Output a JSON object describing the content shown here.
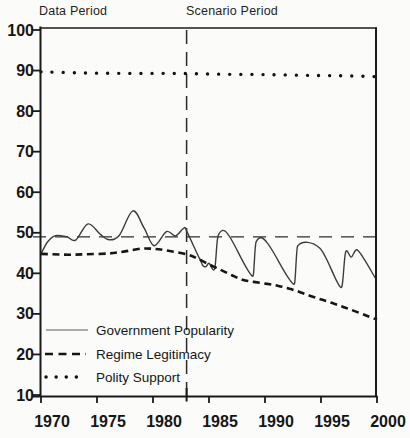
{
  "figure": {
    "annotations": {
      "data_period": "Data Period",
      "scenario_period": "Scenario Period"
    }
  },
  "chart_data": {
    "type": "line",
    "title": "",
    "xlabel": "",
    "ylabel": "",
    "xlim": [
      1970,
      2000
    ],
    "ylim": [
      10,
      100
    ],
    "x_ticks": [
      1970,
      1975,
      1980,
      1985,
      1990,
      1995,
      2000
    ],
    "y_ticks": [
      100,
      90,
      80,
      70,
      60,
      50,
      40,
      30,
      20,
      10
    ],
    "grid": false,
    "legend_position": "lower-left-inside",
    "ink_color": "#1a1a1a",
    "background": "#fbfbf9",
    "annotations": [
      {
        "text": "Data Period",
        "x": 1970,
        "placement": "above-plot-left"
      },
      {
        "text": "Scenario Period",
        "x": 1983,
        "placement": "above-plot-at-divider"
      }
    ],
    "reference_lines": [
      {
        "type": "vertical",
        "x": 1983,
        "style": "long-dash",
        "role": "data-scenario-divider"
      },
      {
        "type": "horizontal",
        "y": 49,
        "style": "long-dash",
        "role": "popularity-baseline"
      }
    ],
    "series": [
      {
        "name": "Government Popularity",
        "style": "solid-thin",
        "points": [
          [
            1970.0,
            44.8
          ],
          [
            1970.6,
            47.8
          ],
          [
            1971.3,
            49.3
          ],
          [
            1972.3,
            49.0
          ],
          [
            1973.1,
            48.2
          ],
          [
            1974.2,
            52.2
          ],
          [
            1975.3,
            49.6
          ],
          [
            1976.1,
            48.3
          ],
          [
            1977.0,
            49.4
          ],
          [
            1978.2,
            55.4
          ],
          [
            1979.2,
            51.2
          ],
          [
            1980.1,
            46.8
          ],
          [
            1981.2,
            50.3
          ],
          [
            1982.0,
            49.2
          ],
          [
            1982.7,
            51.0
          ],
          [
            1983.0,
            50.4
          ],
          [
            1984.3,
            42.8
          ],
          [
            1984.7,
            41.6
          ],
          [
            1985.0,
            42.5
          ],
          [
            1985.5,
            41.1
          ],
          [
            1985.8,
            49.2
          ],
          [
            1986.7,
            49.6
          ],
          [
            1988.9,
            39.3
          ],
          [
            1989.2,
            47.7
          ],
          [
            1990.2,
            47.5
          ],
          [
            1992.6,
            37.3
          ],
          [
            1992.9,
            46.7
          ],
          [
            1994.9,
            46.2
          ],
          [
            1996.8,
            36.5
          ],
          [
            1997.2,
            45.2
          ],
          [
            1997.7,
            44.0
          ],
          [
            1998.3,
            45.6
          ],
          [
            1999.9,
            38.6
          ]
        ]
      },
      {
        "name": "Regime Legitimacy",
        "style": "dashed",
        "points": [
          [
            1970.0,
            44.8
          ],
          [
            1971.0,
            44.7
          ],
          [
            1972.5,
            44.6
          ],
          [
            1974.0,
            44.7
          ],
          [
            1976.0,
            44.9
          ],
          [
            1977.5,
            45.4
          ],
          [
            1979.0,
            46.1
          ],
          [
            1980.2,
            46.0
          ],
          [
            1981.5,
            45.5
          ],
          [
            1983.0,
            44.7
          ],
          [
            1984.0,
            43.6
          ],
          [
            1985.0,
            42.2
          ],
          [
            1986.0,
            40.9
          ],
          [
            1987.0,
            39.6
          ],
          [
            1988.0,
            38.4
          ],
          [
            1989.0,
            37.9
          ],
          [
            1990.2,
            37.4
          ],
          [
            1991.2,
            36.9
          ],
          [
            1992.2,
            36.2
          ],
          [
            1993.2,
            35.3
          ],
          [
            1994.2,
            34.3
          ],
          [
            1995.2,
            33.4
          ],
          [
            1996.2,
            32.5
          ],
          [
            1997.2,
            31.5
          ],
          [
            1998.2,
            30.5
          ],
          [
            1999.2,
            29.4
          ],
          [
            2000.0,
            28.6
          ]
        ]
      },
      {
        "name": "Polity Support",
        "style": "dotted",
        "points": [
          [
            1970.0,
            89.7
          ],
          [
            1974.0,
            89.4
          ],
          [
            1978.0,
            89.3
          ],
          [
            1982.0,
            89.3
          ],
          [
            1986.0,
            89.1
          ],
          [
            1990.0,
            89.0
          ],
          [
            1994.0,
            88.8
          ],
          [
            1997.0,
            88.7
          ],
          [
            2000.0,
            88.5
          ]
        ]
      }
    ]
  }
}
